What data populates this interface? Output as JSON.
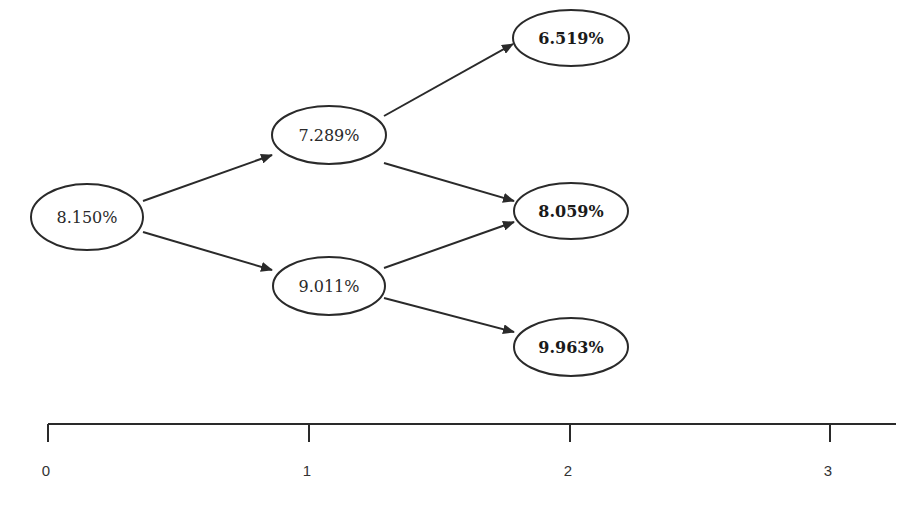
{
  "diagram": {
    "type": "binomial-interest-rate-tree",
    "colors": {
      "stroke": "#2a2a2a",
      "text": "#2a2a2a",
      "background": "#ffffff"
    },
    "nodes": [
      {
        "id": "n0",
        "label": "8.150%",
        "period": 0,
        "bold": false,
        "cx": 87,
        "cy": 217,
        "rx": 56,
        "ry": 33
      },
      {
        "id": "n1u",
        "label": "7.289%",
        "period": 1,
        "bold": false,
        "cx": 329,
        "cy": 135,
        "rx": 57,
        "ry": 29
      },
      {
        "id": "n1d",
        "label": "9.011%",
        "period": 1,
        "bold": false,
        "cx": 329,
        "cy": 286,
        "rx": 56,
        "ry": 29
      },
      {
        "id": "n2uu",
        "label": "6.519%",
        "period": 2,
        "bold": true,
        "cx": 571,
        "cy": 38,
        "rx": 58,
        "ry": 28
      },
      {
        "id": "n2ud",
        "label": "8.059%",
        "period": 2,
        "bold": true,
        "cx": 571,
        "cy": 211,
        "rx": 57,
        "ry": 28
      },
      {
        "id": "n2dd",
        "label": "9.963%",
        "period": 2,
        "bold": true,
        "cx": 571,
        "cy": 347,
        "rx": 57,
        "ry": 29
      }
    ],
    "edges": [
      {
        "from": "n0",
        "to": "n1u",
        "x1": 143,
        "y1": 201,
        "x2": 272,
        "y2": 155
      },
      {
        "from": "n0",
        "to": "n1d",
        "x1": 143,
        "y1": 232,
        "x2": 272,
        "y2": 270
      },
      {
        "from": "n1u",
        "to": "n2uu",
        "x1": 384,
        "y1": 116,
        "x2": 513,
        "y2": 44
      },
      {
        "from": "n1u",
        "to": "n2ud",
        "x1": 384,
        "y1": 163,
        "x2": 514,
        "y2": 201
      },
      {
        "from": "n1d",
        "to": "n2ud",
        "x1": 384,
        "y1": 268,
        "x2": 514,
        "y2": 222
      },
      {
        "from": "n1d",
        "to": "n2dd",
        "x1": 384,
        "y1": 298,
        "x2": 514,
        "y2": 332
      }
    ],
    "axis": {
      "y": 424,
      "x_start": 48,
      "x_end": 896,
      "tick_length": 18,
      "ticks": [
        {
          "label": "0",
          "x": 48
        },
        {
          "label": "1",
          "x": 309
        },
        {
          "label": "2",
          "x": 570
        },
        {
          "label": "3",
          "x": 830
        }
      ]
    }
  }
}
